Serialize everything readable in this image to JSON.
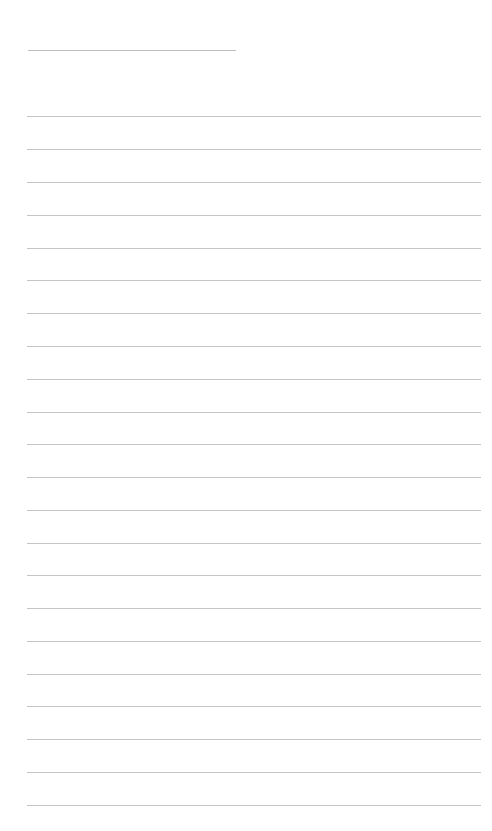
{
  "page": {
    "type": "lined-notepaper",
    "background_color": "#ffffff",
    "line_color": "#c4c4c4",
    "title_line": {
      "left": 28,
      "top": 50,
      "width": 208
    },
    "rules": {
      "left": 27,
      "width": 454,
      "tops": [
        116,
        149,
        182,
        215,
        248,
        280,
        313,
        346,
        379,
        412,
        444,
        477,
        510,
        543,
        575,
        608,
        641,
        674,
        706,
        739,
        772,
        805
      ]
    },
    "text_content": []
  }
}
